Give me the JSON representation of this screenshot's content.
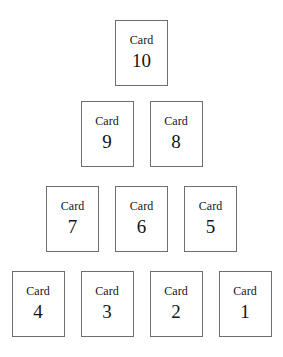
{
  "layout": {
    "shape": "pyramid",
    "card_label_prefix": "Card",
    "background_color": "#ffffff",
    "card_border_color": "#6e6e6e",
    "card_fill_color": "#ffffff",
    "text_color": "#141414"
  },
  "rows": [
    {
      "row_index": 0,
      "cards": [
        {
          "label": "Card",
          "number": "10"
        }
      ]
    },
    {
      "row_index": 1,
      "cards": [
        {
          "label": "Card",
          "number": "9"
        },
        {
          "label": "Card",
          "number": "8"
        }
      ]
    },
    {
      "row_index": 2,
      "cards": [
        {
          "label": "Card",
          "number": "7"
        },
        {
          "label": "Card",
          "number": "6"
        },
        {
          "label": "Card",
          "number": "5"
        }
      ]
    },
    {
      "row_index": 3,
      "cards": [
        {
          "label": "Card",
          "number": "4"
        },
        {
          "label": "Card",
          "number": "3"
        },
        {
          "label": "Card",
          "number": "2"
        },
        {
          "label": "Card",
          "number": "1"
        }
      ]
    }
  ]
}
